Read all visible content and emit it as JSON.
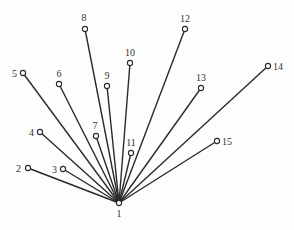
{
  "diagram": {
    "type": "star-tree",
    "root": "1",
    "colors": {
      "edge": "#2a2a2a",
      "node_fill": "#ffffff",
      "label": "#333333",
      "background": "#fdfdfd"
    },
    "nodes": [
      {
        "id": "1",
        "label": "1",
        "x": 119,
        "y": 203,
        "lx": 119,
        "ly": 217,
        "anchor": "middle"
      },
      {
        "id": "2",
        "label": "2",
        "x": 28,
        "y": 168,
        "lx": 21,
        "ly": 172,
        "anchor": "end"
      },
      {
        "id": "3",
        "label": "3",
        "x": 63,
        "y": 169,
        "lx": 57,
        "ly": 173,
        "anchor": "end"
      },
      {
        "id": "4",
        "label": "4",
        "x": 40,
        "y": 132,
        "lx": 34,
        "ly": 136,
        "anchor": "end"
      },
      {
        "id": "5",
        "label": "5",
        "x": 23,
        "y": 73,
        "lx": 17,
        "ly": 77,
        "anchor": "end"
      },
      {
        "id": "6",
        "label": "6",
        "x": 59,
        "y": 84,
        "lx": 59,
        "ly": 77,
        "anchor": "middle"
      },
      {
        "id": "7",
        "label": "7",
        "x": 96,
        "y": 136,
        "lx": 95,
        "ly": 129,
        "anchor": "middle"
      },
      {
        "id": "8",
        "label": "8",
        "x": 85,
        "y": 29,
        "lx": 84,
        "ly": 21,
        "anchor": "middle"
      },
      {
        "id": "9",
        "label": "9",
        "x": 107,
        "y": 86,
        "lx": 107,
        "ly": 79,
        "anchor": "middle"
      },
      {
        "id": "10",
        "label": "10",
        "x": 130,
        "y": 63,
        "lx": 130,
        "ly": 56,
        "anchor": "middle"
      },
      {
        "id": "11",
        "label": "11",
        "x": 131,
        "y": 153,
        "lx": 131,
        "ly": 146,
        "anchor": "middle"
      },
      {
        "id": "12",
        "label": "12",
        "x": 185,
        "y": 29,
        "lx": 185,
        "ly": 22,
        "anchor": "middle"
      },
      {
        "id": "13",
        "label": "13",
        "x": 201,
        "y": 88,
        "lx": 201,
        "ly": 81,
        "anchor": "middle"
      },
      {
        "id": "14",
        "label": "14",
        "x": 268,
        "y": 66,
        "lx": 273,
        "ly": 70,
        "anchor": "start"
      },
      {
        "id": "15",
        "label": "15",
        "x": 217,
        "y": 141,
        "lx": 222,
        "ly": 145,
        "anchor": "start"
      }
    ],
    "edges": [
      {
        "from": "1",
        "to": "2"
      },
      {
        "from": "1",
        "to": "3"
      },
      {
        "from": "1",
        "to": "4"
      },
      {
        "from": "1",
        "to": "5"
      },
      {
        "from": "1",
        "to": "6"
      },
      {
        "from": "1",
        "to": "7"
      },
      {
        "from": "1",
        "to": "8"
      },
      {
        "from": "1",
        "to": "9"
      },
      {
        "from": "1",
        "to": "10"
      },
      {
        "from": "1",
        "to": "11"
      },
      {
        "from": "1",
        "to": "12"
      },
      {
        "from": "1",
        "to": "13"
      },
      {
        "from": "1",
        "to": "14"
      },
      {
        "from": "1",
        "to": "15"
      }
    ]
  }
}
